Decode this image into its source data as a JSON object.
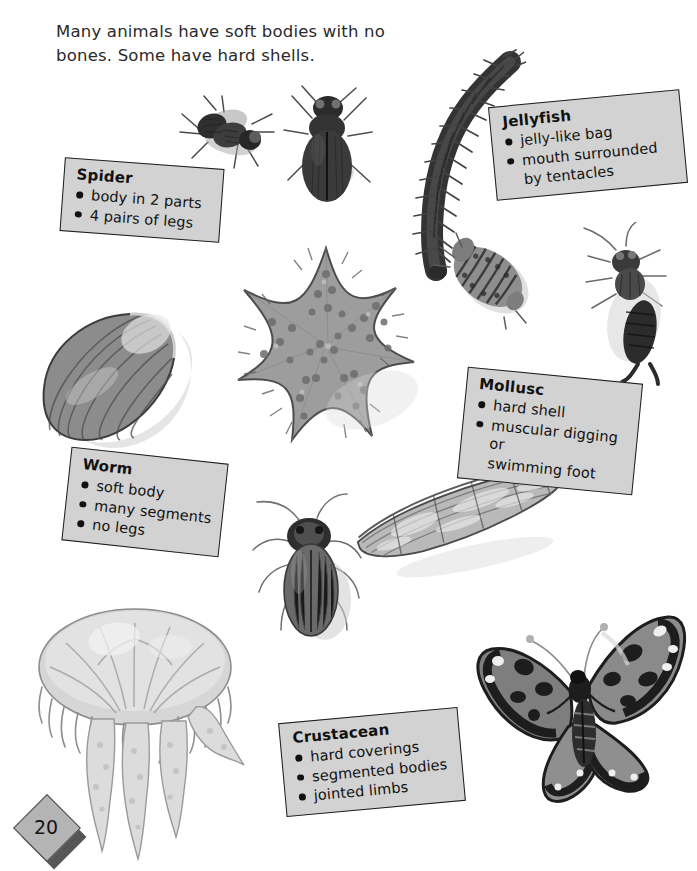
{
  "page": {
    "number": "20",
    "intro": "Many animals have soft bodies with no bones. Some have hard shells."
  },
  "fact_boxes": [
    {
      "id": "spider",
      "title": "Spider",
      "items": [
        "body in 2 parts",
        "4 pairs of legs"
      ]
    },
    {
      "id": "jellyfish",
      "title": "Jellyfish",
      "items": [
        "jelly-like bag",
        "mouth surrounded",
        "by tentacles"
      ],
      "bulleted": [
        true,
        true,
        false
      ]
    },
    {
      "id": "mollusc",
      "title": "Mollusc",
      "items": [
        "hard shell",
        "muscular digging or",
        "swimming foot"
      ],
      "bulleted": [
        true,
        true,
        false
      ]
    },
    {
      "id": "worm",
      "title": "Worm",
      "items": [
        "soft body",
        "many segments",
        "no legs"
      ]
    },
    {
      "id": "crustacean",
      "title": "Crustacean",
      "items": [
        "hard coverings",
        "segmented bodies",
        "jointed limbs"
      ]
    }
  ],
  "illustrations": [
    {
      "id": "fly",
      "name": "fly-illustration"
    },
    {
      "id": "beetle",
      "name": "beetle-illustration"
    },
    {
      "id": "centipede",
      "name": "centipede-illustration"
    },
    {
      "id": "woodlouse",
      "name": "woodlouse-illustration"
    },
    {
      "id": "earwig",
      "name": "earwig-illustration"
    },
    {
      "id": "mussel",
      "name": "mussel-shell-illustration"
    },
    {
      "id": "starfish",
      "name": "starfish-illustration"
    },
    {
      "id": "cockroach",
      "name": "cockroach-illustration"
    },
    {
      "id": "razorshell",
      "name": "razor-shell-illustration"
    },
    {
      "id": "jellyfish",
      "name": "jellyfish-illustration"
    },
    {
      "id": "butterfly",
      "name": "butterfly-illustration"
    }
  ],
  "colors": {
    "box_fill": "#d2d2d2",
    "box_border": "#1c1c1c",
    "badge_front": "#b4b4b4",
    "badge_shadow": "#565656",
    "text": "#1a1a1a",
    "page_background": "#ffffff"
  }
}
